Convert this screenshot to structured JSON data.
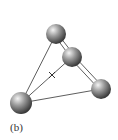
{
  "figure": {
    "label": "(b)",
    "atoms": [
      {
        "id": "top",
        "cx": 56,
        "cy": 34,
        "r": 10
      },
      {
        "id": "middle",
        "cx": 72,
        "cy": 57,
        "r": 10
      },
      {
        "id": "right",
        "cx": 101,
        "cy": 89,
        "r": 10
      },
      {
        "id": "bottom-left",
        "cx": 21,
        "cy": 103,
        "r": 11
      }
    ],
    "center_marker": "+",
    "colors": {
      "sphere_light": "#e8e8e8",
      "sphere_dark": "#404040",
      "line": "#333333"
    }
  }
}
